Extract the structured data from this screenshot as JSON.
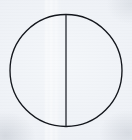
{
  "figure": {
    "title": "Circle with vertical diameter line",
    "medium": "scanned line drawing",
    "canvas": {
      "width": 132,
      "height": 140,
      "background_color": "#eef1f6",
      "paper_tint": "#f4f7fa"
    },
    "shapes": [
      {
        "name": "circle-outline",
        "type": "circle",
        "center_x": 66,
        "center_y": 70.5,
        "radius": 56,
        "stroke_color": "#13161c",
        "stroke_width": 1.35,
        "fill": "none"
      },
      {
        "name": "vertical-diameter",
        "type": "line",
        "x1": 66,
        "y1": 14.5,
        "x2": 66,
        "y2": 126.5,
        "stroke_color": "#1a1e25",
        "stroke_width": 1.25
      }
    ],
    "artifacts": {
      "name": "scan-banding",
      "type": "vertical light streaks",
      "x_range": [
        44,
        62
      ],
      "color": "#ffffff",
      "note": "faint lighter vertical bands left of the diameter line"
    }
  }
}
